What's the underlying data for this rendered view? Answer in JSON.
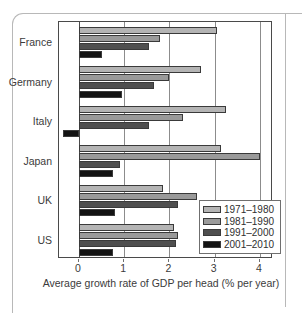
{
  "chart_data": {
    "type": "bar",
    "orientation": "horizontal",
    "title": "",
    "subtitle": "",
    "xlabel": "Average growth rate of GDP per head (% per year)",
    "ylabel": "",
    "categories": [
      "France",
      "Germany",
      "Italy",
      "Japan",
      "UK",
      "US"
    ],
    "series": [
      {
        "name": "1971–1980",
        "color": "#b4b4b4",
        "values": [
          3.05,
          2.7,
          3.25,
          3.15,
          1.85,
          2.1
        ]
      },
      {
        "name": "1981–1990",
        "color": "#9a9a9a",
        "values": [
          1.8,
          2.0,
          2.3,
          4.0,
          2.6,
          2.2
        ]
      },
      {
        "name": "1991–2000",
        "color": "#4f4f4f",
        "values": [
          1.55,
          1.65,
          1.55,
          0.9,
          2.2,
          2.15
        ]
      },
      {
        "name": "2001–2010",
        "color": "#131313",
        "values": [
          0.5,
          0.95,
          -0.35,
          0.75,
          0.8,
          0.75
        ]
      }
    ],
    "xlim": [
      -0.45,
      4.3
    ],
    "xticks": [
      0,
      1,
      2,
      3,
      4
    ],
    "xtick_labels": [
      "0",
      "1",
      "2",
      "3",
      "4"
    ],
    "grid": "vertical",
    "legend_position": "bottom-right"
  },
  "axis": {
    "x_title": "Average growth rate of GDP per head (% per year)",
    "tick_labels": [
      "0",
      "1",
      "2",
      "3",
      "4"
    ]
  },
  "legend": {
    "entries": [
      {
        "label": "1971–1980",
        "color": "#b4b4b4"
      },
      {
        "label": "1981–1990",
        "color": "#9a9a9a"
      },
      {
        "label": "1991–2000",
        "color": "#4f4f4f"
      },
      {
        "label": "2001–2010",
        "color": "#131313"
      }
    ]
  },
  "countries": [
    "France",
    "Germany",
    "Italy",
    "Japan",
    "UK",
    "US"
  ]
}
